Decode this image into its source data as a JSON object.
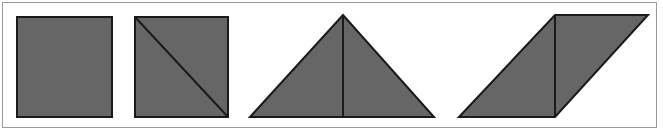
{
  "figure": {
    "title": "Shape decomposition figure",
    "background_color": "#ffffff",
    "frame_color": "#9a9a9a",
    "fill_color": "#666666",
    "outline_color": "#1a1a1a",
    "divider_color": "#1a1a1a",
    "outline_width": 2,
    "divider_width": 2,
    "frame": {
      "x": 2,
      "y": 2,
      "width": 655,
      "height": 126
    }
  },
  "shapes": [
    {
      "name": "square-plain",
      "label": "Square",
      "kind": "square",
      "points": "17,17 112,17 112,117 17,117",
      "dividers": []
    },
    {
      "name": "square-diagonal",
      "label": "Square with diagonal",
      "kind": "square",
      "points": "135,17 228,17 228,117 135,117",
      "dividers": [
        {
          "name": "diagonal-line",
          "x1": 135,
          "y1": 17,
          "x2": 228,
          "y2": 117
        }
      ]
    },
    {
      "name": "triangle-median",
      "label": "Triangle with vertical median",
      "kind": "triangle",
      "points": "250,117 343,15 434,117",
      "dividers": [
        {
          "name": "median-line",
          "x1": 343,
          "y1": 15,
          "x2": 343,
          "y2": 117
        }
      ]
    },
    {
      "name": "parallelogram-divided",
      "label": "Parallelogram with vertical division",
      "kind": "parallelogram",
      "points": "459,117 555,15 648,15 555,117",
      "dividers": [
        {
          "name": "vertical-line",
          "x1": 555,
          "y1": 15,
          "x2": 555,
          "y2": 117
        }
      ]
    }
  ]
}
